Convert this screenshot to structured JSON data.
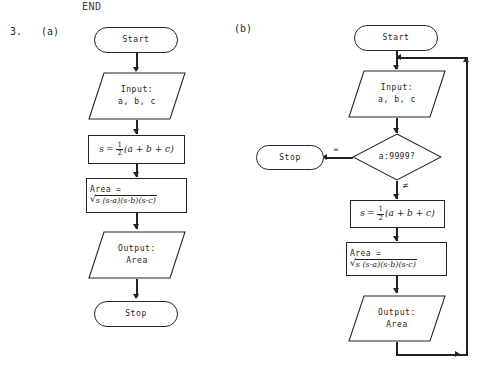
{
  "header": {
    "end_text": "END"
  },
  "exercise": {
    "number": "3.",
    "part_a_label": "(a)",
    "part_b_label": "(b)"
  },
  "flowchart_a": {
    "nodes": [
      {
        "id": "start",
        "type": "terminal",
        "text": "Start"
      },
      {
        "id": "input",
        "type": "io",
        "line1": "Input:",
        "line2": "a, b, c"
      },
      {
        "id": "s_calc",
        "type": "process",
        "formula": "s = 1/2(a + b + c)",
        "parts": {
          "lhs": "s",
          "eq": "=",
          "num": "1",
          "den": "2",
          "rhs": "(a + b + c)"
        }
      },
      {
        "id": "area",
        "type": "process",
        "line1": "Area =",
        "radicand": "s (s-a)(s-b)(s-c)",
        "radical_symbol": "√"
      },
      {
        "id": "output",
        "type": "io",
        "line1": "Output:",
        "line2": "Area"
      },
      {
        "id": "stop",
        "type": "terminal",
        "text": "Stop"
      }
    ]
  },
  "flowchart_b": {
    "nodes": [
      {
        "id": "start",
        "type": "terminal",
        "text": "Start"
      },
      {
        "id": "input",
        "type": "io",
        "line1": "Input:",
        "line2": "a, b, c"
      },
      {
        "id": "decision",
        "type": "decision",
        "text": "a:9999?"
      },
      {
        "id": "stop",
        "type": "terminal",
        "text": "Stop"
      },
      {
        "id": "s_calc",
        "type": "process",
        "formula": "s = 1/2(a + b + c)",
        "parts": {
          "lhs": "s",
          "eq": "=",
          "num": "1",
          "den": "2",
          "rhs": "(a + b + c)"
        }
      },
      {
        "id": "area",
        "type": "process",
        "line1": "Area =",
        "radicand": "s (s-a)(s-b)(s-c)",
        "radical_symbol": "√"
      },
      {
        "id": "output",
        "type": "io",
        "line1": "Output:",
        "line2": "Area"
      }
    ],
    "branches": {
      "equal_label": "=",
      "not_equal_label": "≠"
    }
  },
  "colors": {
    "ink": "#222222",
    "paper": "#ffffff",
    "text": "#1d1d1d"
  }
}
